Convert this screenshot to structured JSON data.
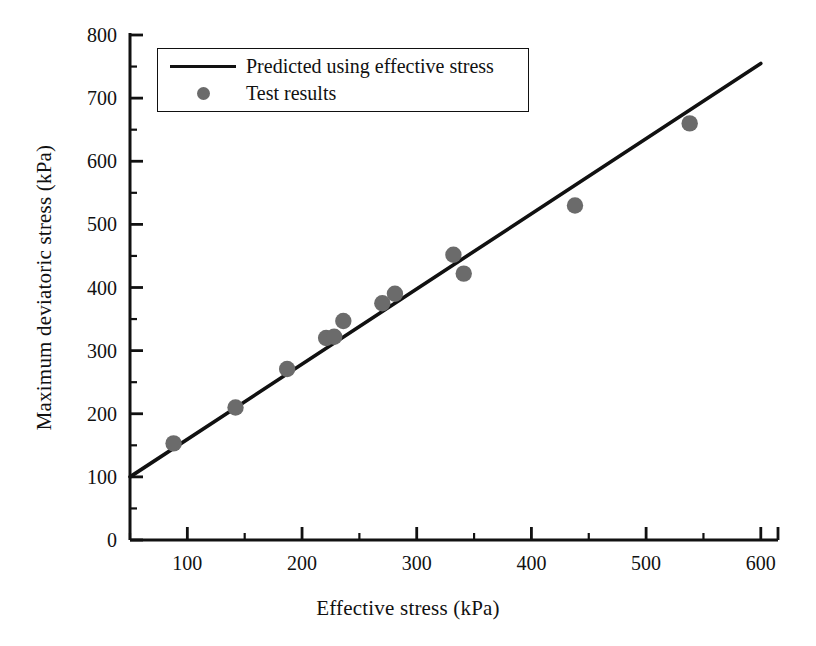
{
  "chart_data": {
    "type": "scatter",
    "title": "",
    "xlabel": "Effective stress (kPa)",
    "ylabel": "Maximum deviatoric stress (kPa)",
    "xlim": [
      50,
      615
    ],
    "ylim": [
      0,
      800
    ],
    "xticks": [
      100,
      200,
      300,
      400,
      500,
      600
    ],
    "xtick_labels": [
      "100",
      "200",
      "300",
      "400",
      "500",
      "600"
    ],
    "x_minor_step": 50,
    "yticks": [
      0,
      100,
      200,
      300,
      400,
      500,
      600,
      700,
      800
    ],
    "ytick_labels": [
      "0",
      "100",
      "200",
      "300",
      "400",
      "500",
      "600",
      "700",
      "800"
    ],
    "y_minor_step": 50,
    "grid": false,
    "legend_position": "upper-center-left",
    "series": [
      {
        "name": "Predicted using effective stress",
        "type": "line",
        "color": "#111111",
        "x": [
          50,
          600
        ],
        "y": [
          100,
          755
        ]
      },
      {
        "name": "Test results",
        "type": "scatter",
        "color": "#6b6b6b",
        "points": [
          {
            "x": 88,
            "y": 153
          },
          {
            "x": 142,
            "y": 210
          },
          {
            "x": 187,
            "y": 271
          },
          {
            "x": 221,
            "y": 320
          },
          {
            "x": 228,
            "y": 322
          },
          {
            "x": 236,
            "y": 347
          },
          {
            "x": 270,
            "y": 375
          },
          {
            "x": 281,
            "y": 390
          },
          {
            "x": 332,
            "y": 452
          },
          {
            "x": 341,
            "y": 422
          },
          {
            "x": 438,
            "y": 530
          },
          {
            "x": 538,
            "y": 660
          }
        ]
      }
    ]
  },
  "legend": {
    "items": [
      {
        "label": "Predicted using effective stress",
        "symbol": "line-swatch"
      },
      {
        "label": "Test results",
        "symbol": "dot-swatch"
      }
    ]
  },
  "colors": {
    "axis": "#111111",
    "line": "#111111",
    "marker": "#6b6b6b",
    "background": "#ffffff"
  }
}
